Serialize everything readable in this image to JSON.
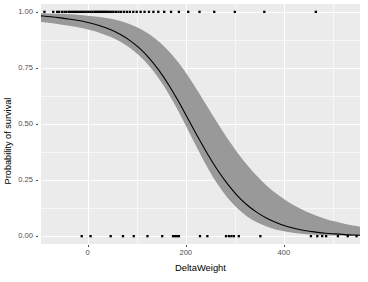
{
  "chart_data": {
    "type": "line",
    "title": "",
    "subtitle": "",
    "xlabel": "DeltaWeight",
    "ylabel": "Probability of survival",
    "xlim": [
      -95,
      555
    ],
    "ylim": [
      -0.035,
      1.035
    ],
    "grid": true,
    "legend": "none",
    "x_ticks": [
      0,
      200,
      400
    ],
    "x_tick_labels": [
      "0",
      "200",
      "400"
    ],
    "x_minor_ticks": [
      -100,
      100,
      300,
      500
    ],
    "y_ticks": [
      0.0,
      0.25,
      0.5,
      0.75,
      1.0
    ],
    "y_tick_labels": [
      "0.00",
      "0.25",
      "0.50",
      "0.75",
      "1.00"
    ],
    "y_minor_ticks": [
      0.125,
      0.375,
      0.625,
      0.875
    ],
    "series": [
      {
        "name": "Fitted logistic probability of survival",
        "type": "line",
        "color": "#000000",
        "linewidth": 1.1,
        "x": [
          -95,
          -75,
          -55,
          -35,
          -15,
          5,
          25,
          45,
          65,
          85,
          105,
          125,
          145,
          165,
          185,
          205,
          225,
          245,
          265,
          285,
          305,
          325,
          345,
          365,
          385,
          405,
          425,
          445,
          465,
          485,
          505,
          525,
          545,
          555
        ],
        "y": [
          0.982,
          0.978,
          0.973,
          0.967,
          0.96,
          0.95,
          0.938,
          0.922,
          0.901,
          0.874,
          0.839,
          0.795,
          0.74,
          0.675,
          0.601,
          0.521,
          0.441,
          0.364,
          0.294,
          0.233,
          0.181,
          0.139,
          0.106,
          0.08,
          0.06,
          0.044,
          0.033,
          0.024,
          0.018,
          0.013,
          0.01,
          0.007,
          0.005,
          0.004
        ]
      },
      {
        "name": "95% confidence band",
        "type": "ribbon",
        "color": "#999999",
        "opacity": 1.0,
        "x": [
          -95,
          -75,
          -55,
          -35,
          -15,
          5,
          25,
          45,
          65,
          85,
          105,
          125,
          145,
          165,
          185,
          205,
          225,
          245,
          265,
          285,
          305,
          325,
          345,
          365,
          385,
          405,
          425,
          445,
          465,
          485,
          505,
          525,
          545,
          555
        ],
        "ymin": [
          0.955,
          0.95,
          0.944,
          0.937,
          0.929,
          0.919,
          0.906,
          0.89,
          0.869,
          0.841,
          0.805,
          0.76,
          0.703,
          0.635,
          0.557,
          0.471,
          0.385,
          0.303,
          0.231,
          0.171,
          0.124,
          0.088,
          0.062,
          0.043,
          0.029,
          0.02,
          0.013,
          0.009,
          0.006,
          0.004,
          0.003,
          0.002,
          0.001,
          0.001
        ],
        "ymax": [
          0.994,
          0.993,
          0.991,
          0.989,
          0.986,
          0.982,
          0.977,
          0.97,
          0.96,
          0.946,
          0.927,
          0.901,
          0.868,
          0.826,
          0.774,
          0.713,
          0.645,
          0.574,
          0.503,
          0.435,
          0.373,
          0.317,
          0.268,
          0.225,
          0.189,
          0.158,
          0.132,
          0.11,
          0.092,
          0.077,
          0.065,
          0.054,
          0.046,
          0.042
        ]
      },
      {
        "name": "Observed outcome = survived (rug, y = 1.00)",
        "type": "scatter",
        "color": "#000000",
        "y_value": 1.0,
        "x": [
          -88,
          -70,
          -62,
          -58,
          -52,
          -47,
          -43,
          -38,
          -34,
          -30,
          -26,
          -22,
          -18,
          -14,
          -10,
          -6,
          -2,
          2,
          6,
          10,
          14,
          17,
          20,
          23,
          26,
          29,
          32,
          35,
          38,
          41,
          45,
          49,
          53,
          58,
          63,
          68,
          74,
          80,
          86,
          93,
          100,
          108,
          116,
          125,
          134,
          144,
          156,
          170,
          186,
          205,
          228,
          258,
          300,
          360,
          465
        ]
      },
      {
        "name": "Observed outcome = died (rug, y = 0.00)",
        "type": "scatter",
        "color": "#000000",
        "y_value": 0.0,
        "x": [
          -12,
          6,
          47,
          72,
          94,
          122,
          152,
          174,
          178,
          182,
          186,
          229,
          244,
          282,
          288,
          293,
          298,
          308,
          352,
          455,
          468,
          478,
          486,
          510,
          530,
          548
        ]
      }
    ]
  },
  "axes": {
    "y_title": "Probability of survival",
    "x_title": "DeltaWeight",
    "y_tick_labels": [
      "1.00",
      "0.75",
      "0.50",
      "0.25",
      "0.00"
    ],
    "x_tick_labels": [
      "0",
      "200",
      "400"
    ]
  },
  "style": {
    "panel_background": "#ebebeb",
    "major_grid_color": "#ffffff",
    "minor_grid_color": "#f7f7f7",
    "ribbon_color": "#999999",
    "line_color": "#000000",
    "point_color": "#000000",
    "text_color": "#4d4d4d",
    "title_color": "#000000",
    "page_background": "#ffffff"
  }
}
